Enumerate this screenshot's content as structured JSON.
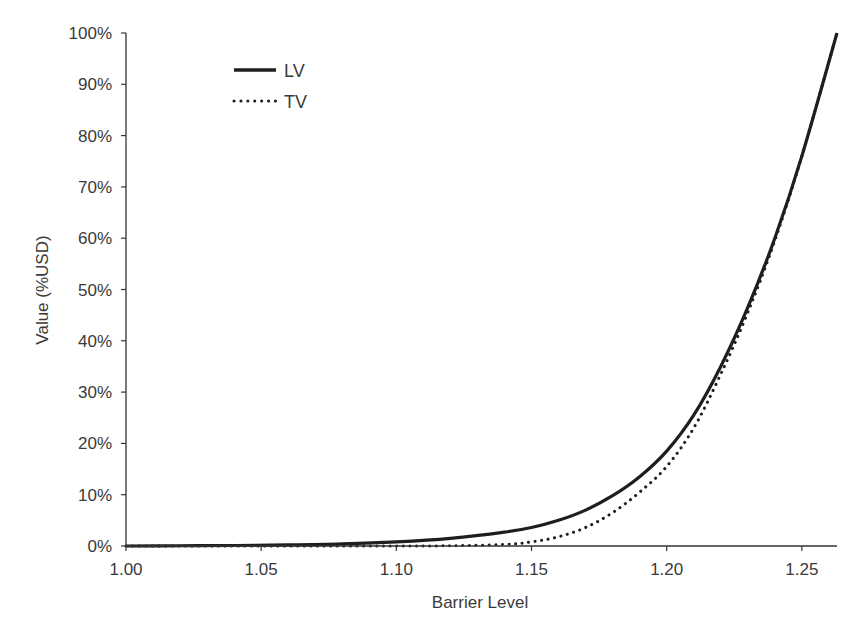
{
  "chart_data": {
    "type": "line",
    "title": "",
    "xlabel": "Barrier Level",
    "ylabel": "Value (%USD)",
    "xlim": [
      1.0,
      1.263
    ],
    "ylim": [
      0,
      100
    ],
    "x_ticks": [
      1.0,
      1.05,
      1.1,
      1.15,
      1.2,
      1.25
    ],
    "x_tick_labels": [
      "1.00",
      "1.05",
      "1.10",
      "1.15",
      "1.20",
      "1.25"
    ],
    "y_ticks": [
      0,
      10,
      20,
      30,
      40,
      50,
      60,
      70,
      80,
      90,
      100
    ],
    "y_tick_labels": [
      "0%",
      "10%",
      "20%",
      "30%",
      "40%",
      "50%",
      "60%",
      "70%",
      "80%",
      "90%",
      "100%"
    ],
    "grid": false,
    "legend_position": "upper-left",
    "x": [
      1.0,
      1.02,
      1.04,
      1.06,
      1.08,
      1.1,
      1.12,
      1.14,
      1.15,
      1.16,
      1.17,
      1.18,
      1.19,
      1.2,
      1.21,
      1.22,
      1.23,
      1.24,
      1.25,
      1.263
    ],
    "series": [
      {
        "name": "LV",
        "style": "solid",
        "values": [
          0.0,
          0.05,
          0.1,
          0.2,
          0.4,
          0.8,
          1.5,
          2.7,
          3.6,
          5.0,
          7.0,
          9.8,
          13.5,
          18.5,
          25.5,
          35.0,
          46.5,
          60.0,
          76.0,
          100.0
        ]
      },
      {
        "name": "TV",
        "style": "dotted",
        "values": [
          0.0,
          0.0,
          0.0,
          0.0,
          0.0,
          0.0,
          0.05,
          0.3,
          0.8,
          1.8,
          3.6,
          6.5,
          10.5,
          15.5,
          23.0,
          33.5,
          45.5,
          59.5,
          76.0,
          100.0
        ]
      }
    ]
  }
}
